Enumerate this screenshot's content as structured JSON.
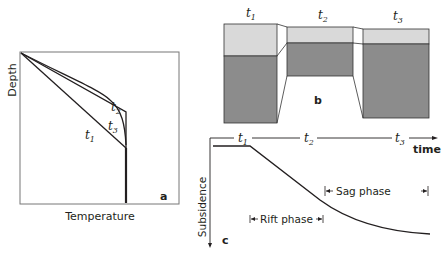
{
  "panel_a": {
    "label": "a",
    "x_axis_label": "Temperature",
    "y_axis_label": "Depth",
    "curves": [
      {
        "name": "t",
        "sub": "1"
      },
      {
        "name": "t",
        "sub": "2"
      },
      {
        "name": "t",
        "sub": "3"
      }
    ]
  },
  "panel_b": {
    "label": "b",
    "columns": [
      {
        "name": "t",
        "sub": "1"
      },
      {
        "name": "t",
        "sub": "2"
      },
      {
        "name": "t",
        "sub": "3"
      }
    ],
    "colors": {
      "upper_layer": "#d9d9d9",
      "lower_layer": "#8c8c8c",
      "outline": "#333333"
    }
  },
  "panel_c": {
    "label": "c",
    "x_axis_label": "time",
    "y_axis_label": "Subsidence",
    "time_marks": [
      {
        "name": "t",
        "sub": "1"
      },
      {
        "name": "t",
        "sub": "2"
      },
      {
        "name": "t",
        "sub": "3"
      }
    ],
    "phases": [
      {
        "label": "Rift phase"
      },
      {
        "label": "Sag phase"
      }
    ]
  }
}
